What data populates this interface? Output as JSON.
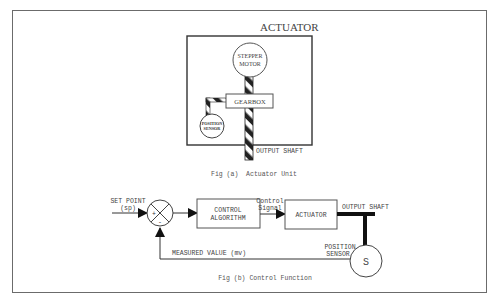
{
  "fig_a": {
    "title": "ACTUATOR",
    "motor_line1": "STEPPER",
    "motor_line2": "MOTOR",
    "gearbox": "GEARBOX",
    "sensor_line1": "POSITION",
    "sensor_line2": "SENSOR",
    "output_shaft": "OUTPUT SHAFT",
    "caption": "Fig (a)  Actuator Unit"
  },
  "fig_b": {
    "set_point_line1": "SET POINT",
    "set_point_line2": "(sp)",
    "plus": "+",
    "minus": "-",
    "control_line1": "CONTROL",
    "control_line2": "ALGORITHM",
    "signal_line1": "Control",
    "signal_line2": "Signal",
    "actuator": "ACTUATOR",
    "output_shaft": "OUTPUT SHAFT",
    "sensor_line1": "POSITION",
    "sensor_line2": "SENSOR",
    "sensor_symbol": "S",
    "measured_value": "MEASURED VALUE (mv)",
    "caption": "Fig (b) Control Function"
  },
  "colors": {
    "line": "#3a3a3a",
    "frame": "#6b6b6b",
    "text": "#444444"
  }
}
